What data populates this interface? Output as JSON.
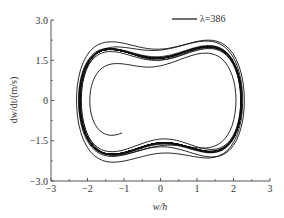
{
  "chart_data": {
    "type": "line",
    "title": "",
    "xlabel": "w/h",
    "ylabel": "dw/dt/(m/s)",
    "xlim": [
      -3,
      3
    ],
    "ylim": [
      -3.0,
      3.0
    ],
    "xticks": [
      -3,
      -2,
      -1,
      0,
      1,
      2,
      3
    ],
    "xtick_labels": [
      "−3",
      "−2",
      "−1",
      "0",
      "1",
      "2",
      "3"
    ],
    "yticks": [
      -3.0,
      -1.5,
      0,
      1.5,
      3.0
    ],
    "ytick_labels": [
      "−3.0",
      "−1.5",
      "0",
      "1.5",
      "3.0"
    ],
    "grid": false,
    "legend": {
      "position": "upper right",
      "entries": [
        "λ=386"
      ]
    },
    "series": [
      {
        "name": "λ=386",
        "description": "Chaotic phase-plane trajectory (double-well attractor) with dense spiral cores near w/h≈−1.3 and w/h≈+1.2, outer lobes reaching w/h≈−2.2 and +2.3, dw/dt range ≈ −2.3 to +2.3",
        "color": "#111111",
        "approx_extent": {
          "w_min": -2.2,
          "w_max": 2.3,
          "v_min": -2.3,
          "v_max": 2.3
        },
        "spiral_centers": [
          [
            -1.3,
            0.0
          ],
          [
            1.2,
            0.0
          ]
        ]
      }
    ]
  },
  "plot": {
    "frame_px": {
      "left": 51,
      "right": 270,
      "top": 20,
      "bottom": 181
    },
    "line_color": "#111111",
    "axis_color": "#555555"
  },
  "sim": {
    "alpha": -1.0,
    "beta": 1.0,
    "delta": 0.18,
    "gamma": 0.42,
    "omega": 1.0,
    "dt": 0.02,
    "steps": 60000,
    "skip": 800,
    "w_scale": 1.0,
    "v_scale": 1.0
  },
  "legend": {
    "label": "λ=386"
  }
}
